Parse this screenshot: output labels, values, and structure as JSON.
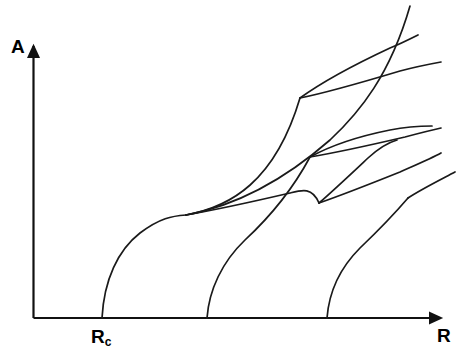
{
  "figure": {
    "title": "",
    "background_color": "#ffffff",
    "line_color": "#1a1a1a",
    "width": 465,
    "height": 354
  },
  "axes": {
    "y_axis_label": "A",
    "x_axis_label": "R",
    "critical_point_label": "R",
    "critical_point_subscript": "c",
    "origin": {
      "x": 33,
      "y": 318
    },
    "x_arrow_tip": {
      "x": 447,
      "y": 318
    },
    "y_arrow_tip": {
      "x": 33,
      "y": 40
    }
  },
  "chart_data": {
    "type": "line",
    "title": "",
    "xlabel": "R",
    "ylabel": "A",
    "grid": false,
    "legend": null,
    "axis_style": "arrow-axes, no ticks, no numeric tick labels",
    "annotations": [
      {
        "text": "R_c",
        "x": 102,
        "y": 318,
        "description": "critical Rayleigh number at which the first branch emerges from the trivial state"
      }
    ],
    "xlim": [
      33,
      447
    ],
    "ylim": [
      0,
      318
    ],
    "branch_points": [
      {
        "name": "onset-1",
        "x": 102,
        "y": 318
      },
      {
        "name": "onset-2",
        "x": 207,
        "y": 318
      },
      {
        "name": "onset-3",
        "x": 327,
        "y": 318
      },
      {
        "name": "secondary-1",
        "x": 186,
        "y": 215
      },
      {
        "name": "secondary-2",
        "x": 300,
        "y": 98
      },
      {
        "name": "secondary-3",
        "x": 310,
        "y": 157
      },
      {
        "name": "secondary-4",
        "x": 319,
        "y": 203
      }
    ],
    "series": [
      {
        "name": "primary-branch-1",
        "path": "M 102,318 C 104,280 118,250 140,233 C 160,218 172,216 186,215",
        "start": [
          102,
          318
        ],
        "end": [
          186,
          215
        ]
      },
      {
        "name": "primary-branch-1-continued",
        "path": "M 186,215 C 230,207 275,182 300,98",
        "start": [
          186,
          215
        ],
        "end": [
          300,
          98
        ]
      },
      {
        "name": "branch-1-upper-after-secondary-1",
        "path": "M 186,215 C 240,205 290,175 330,140 C 360,112 390,75 410,6",
        "start": [
          186,
          215
        ],
        "end": [
          410,
          6
        ]
      },
      {
        "name": "branch-1a-after-secondary-2",
        "path": "M 300,98 C 325,80 360,62 390,48 C 400,44 408,40 418,35",
        "start": [
          300,
          98
        ],
        "end": [
          418,
          35
        ]
      },
      {
        "name": "branch-1b-after-secondary-2",
        "path": "M 300,98 C 330,92 370,80 400,71 C 415,67 430,64 441,62",
        "start": [
          300,
          98
        ],
        "end": [
          441,
          62
        ]
      },
      {
        "name": "primary-branch-2",
        "path": "M 207,318 C 209,290 222,262 245,240 C 272,215 295,185 310,157",
        "start": [
          207,
          318
        ],
        "end": [
          310,
          157
        ]
      },
      {
        "name": "branch-2a-after-secondary-3",
        "path": "M 310,157 C 330,146 360,136 390,130 C 405,127 420,126 432,126",
        "start": [
          310,
          157
        ],
        "end": [
          432,
          126
        ]
      },
      {
        "name": "branch-2b-after-secondary-3",
        "path": "M 310,157 C 340,152 375,144 405,137 C 420,133 432,130 441,128",
        "start": [
          310,
          157
        ],
        "end": [
          441,
          128
        ]
      },
      {
        "name": "primary-branch-3",
        "path": "M 327,318 C 329,292 340,268 360,248 C 382,227 396,212 408,198",
        "start": [
          327,
          318
        ],
        "end": [
          408,
          198
        ]
      },
      {
        "name": "branch-3-extension",
        "path": "M 408,198 C 420,190 436,182 455,172",
        "start": [
          408,
          198
        ],
        "end": [
          455,
          172
        ]
      },
      {
        "name": "primary-branch-2-lower-secondary",
        "path": "M 319,203 C 345,194 375,182 400,172 C 418,164 432,158 441,153",
        "start": [
          319,
          203
        ],
        "end": [
          441,
          153
        ]
      },
      {
        "name": "branch-secondary-4-upper",
        "path": "M 319,203 C 334,190 352,173 368,158 C 380,147 390,142 397,140",
        "start": [
          319,
          203
        ],
        "end": [
          397,
          140
        ]
      },
      {
        "name": "lower-left-long-branch",
        "path": "M 186,215 C 220,209 260,200 290,193 C 302,190 312,187 319,203",
        "start": [
          186,
          215
        ],
        "end": [
          319,
          203
        ]
      }
    ]
  }
}
